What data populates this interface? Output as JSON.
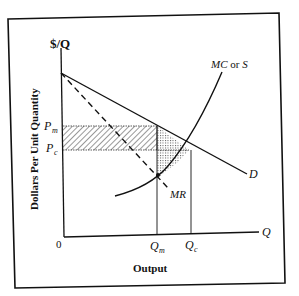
{
  "diagram": {
    "type": "monopoly vs competition deadweight loss",
    "y_axis_symbol": "$/Q",
    "y_axis_title": "Dollars Per Unit Quantity",
    "x_axis_symbol": "Q",
    "x_axis_title": "Output",
    "origin_label": "0",
    "price_labels": {
      "pm_main": "P",
      "pm_sub": "m",
      "pc_main": "P",
      "pc_sub": "c"
    },
    "quantity_labels": {
      "qm_main": "Q",
      "qm_sub": "m",
      "qc_main": "Q",
      "qc_sub": "c"
    },
    "curves": {
      "demand": "D",
      "marginal_revenue": "MR",
      "marginal_cost_prefix": "MC",
      "marginal_cost_or": " or ",
      "marginal_cost_suffix": "S"
    },
    "colors": {
      "line": "#111111",
      "background": "#ffffff",
      "hatch": "#333333",
      "stipple": "#555555"
    }
  }
}
